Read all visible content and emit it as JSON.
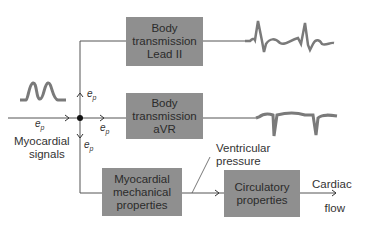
{
  "diagram": {
    "blocks": [
      {
        "id": "lead2",
        "lines": [
          "Body",
          "transmission",
          "Lead II"
        ]
      },
      {
        "id": "avr",
        "lines": [
          "Body",
          "transmission",
          "aVR"
        ]
      },
      {
        "id": "mech",
        "lines": [
          "Myocardial",
          "mechanical",
          "properties"
        ]
      },
      {
        "id": "circ",
        "lines": [
          "Circulatory",
          "properties"
        ]
      }
    ],
    "labels": {
      "input_line1": "Myocardial",
      "input_line2": "signals",
      "ventricular_line1": "Ventricular",
      "ventricular_line2": "pressure",
      "output_line1": "Cardiac",
      "output_line2": "flow"
    },
    "signal_symbol": {
      "base": "e",
      "subscript": "p"
    },
    "colors": {
      "block_fill": "#8f8f8f",
      "wire": "#555555",
      "waveform": "#7a7a7a"
    }
  }
}
